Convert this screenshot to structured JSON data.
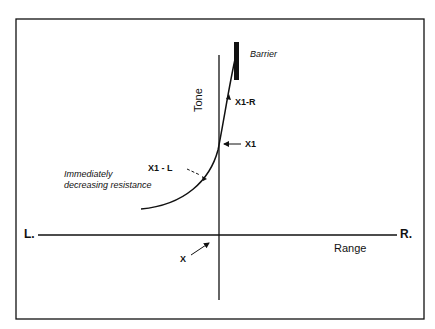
{
  "diagram": {
    "labels": {
      "left_end": "L.",
      "right_end": "R.",
      "x_axis": "Range",
      "y_axis": "Tone",
      "barrier": "Barrier",
      "x1_r": "X1-R",
      "x1": "X1",
      "x1_l": "X1 - L",
      "resistance_line1": "Immediately",
      "resistance_line2": "decreasing resistance",
      "x": "X"
    },
    "colors": {
      "ink": "#111111",
      "background": "#ffffff"
    }
  }
}
